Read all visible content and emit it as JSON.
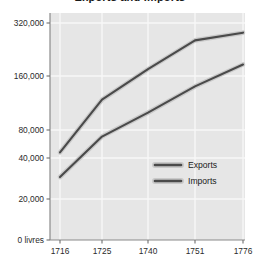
{
  "title": "Exports and Imports",
  "chart_data": {
    "type": "line",
    "title": "Exports and Imports",
    "xlabel": "",
    "ylabel": "",
    "unit": "livres",
    "yscale": "log",
    "grid": true,
    "legend_position": "center-right",
    "x": [
      "1716",
      "1725",
      "1740",
      "1751",
      "1776"
    ],
    "categories": [
      "1716",
      "1725",
      "1740",
      "1751",
      "1776"
    ],
    "ytick_labels": [
      "320,000",
      "160,000",
      "80,000",
      "40,000",
      "20,000",
      "0 livres"
    ],
    "ytick_values": [
      320000,
      160000,
      80000,
      40000,
      20000,
      0
    ],
    "ylim": [
      0,
      320000
    ],
    "series": [
      {
        "name": "Exports",
        "color": "#4a4a4a",
        "values": [
          46000,
          118000,
          175000,
          255000,
          282000
        ]
      },
      {
        "name": "Imports",
        "color": "#4a4a4a",
        "values": [
          29000,
          68000,
          100000,
          140000,
          186000
        ]
      }
    ],
    "legend": [
      "Exports",
      "Imports"
    ]
  },
  "axis": {
    "y_ticks": [
      {
        "label": "320,000"
      },
      {
        "label": "160,000"
      },
      {
        "label": "80,000"
      },
      {
        "label": "40,000"
      },
      {
        "label": "20,000"
      },
      {
        "label": "0 livres"
      }
    ],
    "x_ticks": [
      {
        "label": "1716"
      },
      {
        "label": "1725"
      },
      {
        "label": "1740"
      },
      {
        "label": "1751"
      },
      {
        "label": "1776"
      }
    ]
  },
  "legend": {
    "items": [
      {
        "label": "Exports"
      },
      {
        "label": "Imports"
      }
    ]
  },
  "colors": {
    "plot_background": "#e6e6e6",
    "gridline": "#f7f7f7",
    "line": "#4a4a4a",
    "line_halo": "#c9c9c9",
    "axis": "#8a8a8a",
    "text": "#2b2b2b",
    "page_background": "#ffffff"
  }
}
